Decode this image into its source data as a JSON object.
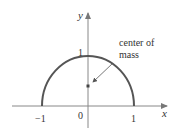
{
  "figure": {
    "type": "semicircle-center-of-mass",
    "axes": {
      "x_label": "x",
      "y_label": "y",
      "x_ticks": [
        "−1",
        "0",
        "1"
      ],
      "y_ticks": [
        "1"
      ]
    },
    "curve": {
      "description": "upper semicircle of radius 1 centered at origin",
      "x_range": [
        -1,
        1
      ],
      "color": "#555555"
    },
    "point": {
      "label": "center of mass",
      "label_line1": "center of",
      "label_line2": "mass"
    },
    "colors": {
      "axes": "#888888",
      "curve": "#555555",
      "text": "#333333"
    }
  }
}
